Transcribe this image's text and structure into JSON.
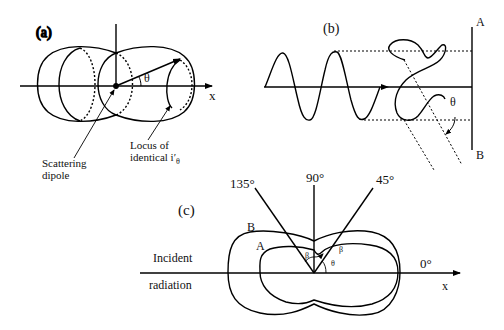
{
  "panel_a": {
    "label": "(a)",
    "axis_x": "x",
    "angle": "θ",
    "callout_dipole": [
      "Scattering",
      "dipole"
    ],
    "callout_locus_line1": "Locus of",
    "callout_locus_line2": "identical i′",
    "callout_locus_sub": "θ"
  },
  "panel_b": {
    "label": "(b)",
    "screen_top": "A",
    "screen_bottom": "B",
    "angle": "θ"
  },
  "panel_c": {
    "label": "(c)",
    "angle_135": "135°",
    "angle_90": "90°",
    "angle_45": "45°",
    "angle_0": "0°",
    "curve_outer": "B",
    "curve_inner": "A",
    "incident_line1": "Incident",
    "incident_line2": "radiation",
    "axis_x": "x",
    "beta_left": "β",
    "beta_right": "β",
    "theta": "θ"
  }
}
